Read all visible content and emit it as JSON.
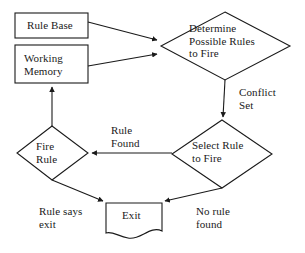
{
  "diagram": {
    "type": "flowchart",
    "background_color": "#ffffff",
    "stroke_color": "#1a1a1a",
    "text_color": "#1a1a1a"
  },
  "nodes": [
    {
      "id": "rule-base",
      "shape": "rectangle",
      "label": "Rule Base",
      "lines": [
        "Rule Base"
      ]
    },
    {
      "id": "working-memory",
      "shape": "rectangle",
      "label": "Working Memory",
      "lines": [
        "Working",
        "Memory"
      ]
    },
    {
      "id": "determine-possible-rules",
      "shape": "diamond",
      "label": "Determine Possible Rules to Fire",
      "lines": [
        "Determine",
        "Possible Rules",
        "to Fire"
      ]
    },
    {
      "id": "select-rule",
      "shape": "diamond",
      "label": "Select Rule to Fire",
      "lines": [
        "Select Rule",
        "to Fire"
      ]
    },
    {
      "id": "fire-rule",
      "shape": "diamond",
      "label": "Fire Rule",
      "lines": [
        "Fire",
        "Rule"
      ]
    },
    {
      "id": "exit",
      "shape": "document",
      "label": "Exit",
      "lines": [
        "Exit"
      ]
    }
  ],
  "edge_labels": [
    {
      "id": "conflict-set",
      "label": "Conflict Set",
      "lines": [
        "Conflict",
        "Set"
      ]
    },
    {
      "id": "rule-found",
      "label": "Rule Found",
      "lines": [
        "Rule",
        "Found"
      ]
    },
    {
      "id": "rule-says-exit",
      "label": "Rule says exit",
      "lines": [
        "Rule says",
        "exit"
      ]
    },
    {
      "id": "no-rule-found",
      "label": "No rule found",
      "lines": [
        "No rule",
        "found"
      ]
    }
  ],
  "edges": [
    {
      "id": "rule-base-to-determine",
      "from": "rule-base",
      "to": "determine-possible-rules",
      "label": ""
    },
    {
      "id": "working-memory-to-determine",
      "from": "working-memory",
      "to": "determine-possible-rules",
      "label": ""
    },
    {
      "id": "determine-to-select",
      "from": "determine-possible-rules",
      "to": "select-rule",
      "label": "Conflict Set"
    },
    {
      "id": "select-to-fire-rule",
      "from": "select-rule",
      "to": "fire-rule",
      "label": "Rule Found"
    },
    {
      "id": "fire-rule-to-working-memory",
      "from": "fire-rule",
      "to": "working-memory",
      "label": ""
    },
    {
      "id": "fire-rule-to-exit",
      "from": "fire-rule",
      "to": "exit",
      "label": "Rule says exit"
    },
    {
      "id": "select-to-exit",
      "from": "select-rule",
      "to": "exit",
      "label": "No rule found"
    }
  ]
}
